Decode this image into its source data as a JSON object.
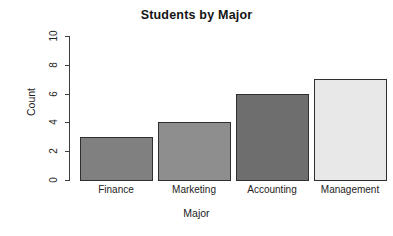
{
  "chart_data": {
    "type": "bar",
    "title": "Students by Major",
    "xlabel": "Major",
    "ylabel": "Count",
    "categories": [
      "Finance",
      "Marketing",
      "Accounting",
      "Management"
    ],
    "values": [
      3,
      4,
      6,
      7
    ],
    "ylim": [
      0,
      10
    ],
    "ytick_labels": [
      "0",
      "2",
      "4",
      "6",
      "8",
      "10"
    ],
    "ytick_values": [
      0,
      2,
      4,
      6,
      8,
      10
    ],
    "grid": false,
    "legend": false,
    "bar_colors": [
      "#808080",
      "#8e8e8e",
      "#6e6e6e",
      "#e8e8e8"
    ],
    "bar_border_color": "#2f2f2f",
    "axis_color": "#3d3d3d",
    "background_color": "#ffffff"
  }
}
